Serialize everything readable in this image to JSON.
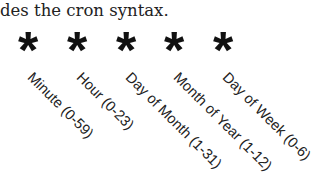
{
  "intro_text": "des the cron syntax.",
  "fields": [
    {
      "symbol": "*",
      "label": "Minute (0-59)"
    },
    {
      "symbol": "*",
      "label": "Hour (0-23)"
    },
    {
      "symbol": "*",
      "label": "Day of Month (1-31)"
    },
    {
      "symbol": "*",
      "label": "Month of Year (1-12)"
    },
    {
      "symbol": "*",
      "label": "Day of Week (0-6)"
    }
  ]
}
